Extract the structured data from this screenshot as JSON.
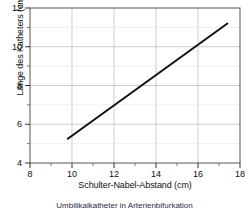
{
  "chart_data": {
    "type": "line",
    "title": "",
    "xlabel": "Schulter-Nabel-Abstand (cm)",
    "ylabel": "Länge des Katheters (cm)",
    "xlim": [
      8,
      18
    ],
    "ylim": [
      4,
      12
    ],
    "xticks": [
      8,
      10,
      12,
      14,
      16,
      18
    ],
    "yticks": [
      4,
      6,
      8,
      10,
      12
    ],
    "xtick_labels": [
      "8",
      "10",
      "12",
      "14",
      "16",
      "18"
    ],
    "ytick_labels": [
      "4",
      "6",
      "8",
      "10",
      "12"
    ],
    "xminorticks": [
      9,
      11,
      13,
      15,
      17
    ],
    "yminorticks": [
      5,
      7,
      9,
      11
    ],
    "grid": true,
    "grid_color": "#b9b9b9",
    "legend": "none",
    "line_color": "#111111",
    "series": [
      {
        "name": "Kathetertiefe",
        "x": [
          9.8,
          17.4
        ],
        "y": [
          5.25,
          11.2
        ]
      }
    ],
    "annotations": []
  },
  "figure": {
    "caption": "Umbilikalkatheter in Arterienbifurkation"
  }
}
